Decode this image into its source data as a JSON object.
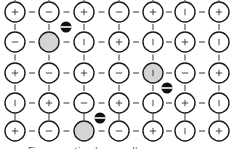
{
  "diagram": {
    "title": "",
    "grid": {
      "cols": 7,
      "rows": 5
    },
    "colors": {
      "stroke": "#1a1a1a",
      "bond": "#555555",
      "symbol": "#333333",
      "vacancy_fill": "#d4d4d4",
      "hole_fill": "#111111",
      "hole_stripe": "#ffffff"
    },
    "col_x": [
      15,
      49,
      84,
      119,
      153,
      185,
      219
    ],
    "row_y": [
      12,
      42,
      73,
      103,
      131
    ],
    "radius": 10,
    "cells": [
      [
        "+",
        "−",
        "+",
        "−",
        "+",
        "|",
        "+"
      ],
      [
        "−",
        "",
        "|",
        "+",
        "|",
        "+",
        "|"
      ],
      [
        "+",
        "−",
        "+",
        "−",
        "|",
        "−",
        "+"
      ],
      [
        "|",
        "+",
        "−",
        "+",
        "|",
        "+",
        "|"
      ],
      [
        "+",
        "−",
        "",
        "−",
        "+",
        "|",
        "+"
      ]
    ],
    "vacancies": [
      {
        "row": 1,
        "col": 1
      },
      {
        "row": 2,
        "col": 4
      },
      {
        "row": 4,
        "col": 2
      }
    ],
    "holes": [
      {
        "x": 66,
        "y": 27
      },
      {
        "x": 167,
        "y": 88
      },
      {
        "x": 100,
        "y": 118
      }
    ],
    "caption": "Figure caption (cropped)"
  }
}
